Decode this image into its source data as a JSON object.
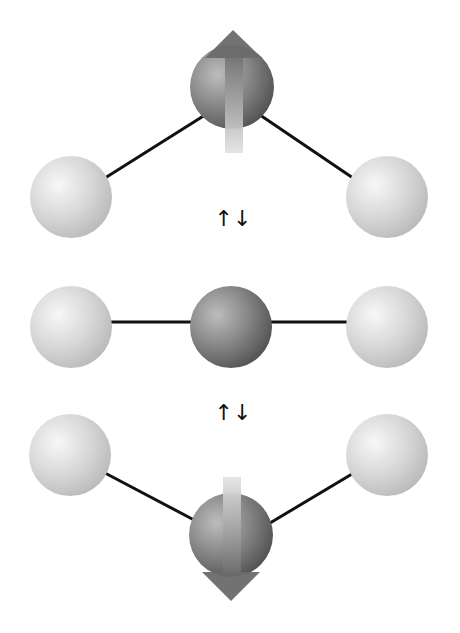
{
  "diagram": {
    "type": "molecular-vibration",
    "transition_symbol": "↑↓",
    "colors": {
      "background": "#ffffff",
      "outer_atom_light": "#f4f4f4",
      "outer_atom_dark": "#b8b8b8",
      "central_atom_light": "#b4b4b4",
      "central_atom_dark": "#4a4a4a",
      "bond": "#111111",
      "arrow_head": "#6a6a6a",
      "arrow_shaft_top": "#707070",
      "arrow_shaft_bottom": "#e2e2e2"
    },
    "states": [
      {
        "name": "bent-up",
        "central_atom": {
          "cx": 232,
          "cy": 87,
          "r": 42
        },
        "left_atom": {
          "cx": 71,
          "cy": 197,
          "r": 41
        },
        "right_atom": {
          "cx": 387,
          "cy": 197,
          "r": 41
        },
        "displacement_arrow": "up"
      },
      {
        "name": "linear",
        "central_atom": {
          "cx": 231,
          "cy": 327,
          "r": 41
        },
        "left_atom": {
          "cx": 71,
          "cy": 327,
          "r": 41
        },
        "right_atom": {
          "cx": 387,
          "cy": 327,
          "r": 41
        },
        "displacement_arrow": "none"
      },
      {
        "name": "bent-down",
        "central_atom": {
          "cx": 231,
          "cy": 535,
          "r": 42
        },
        "left_atom": {
          "cx": 70,
          "cy": 455,
          "r": 41
        },
        "right_atom": {
          "cx": 387,
          "cy": 455,
          "r": 41
        },
        "displacement_arrow": "down"
      }
    ],
    "transitions": [
      {
        "label": "↑↓",
        "x": 233,
        "y": 226
      },
      {
        "label": "↑↓",
        "x": 233,
        "y": 420
      }
    ]
  }
}
